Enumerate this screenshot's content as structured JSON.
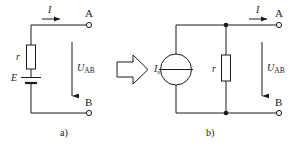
{
  "figure": {
    "background_color": "#ffffff",
    "line_color": "#1a1a1a",
    "captions": [
      {
        "id": "caption-a",
        "text": "a)"
      },
      {
        "id": "caption-b",
        "text": "b)"
      }
    ],
    "transform_arrow": {
      "name": "equivalence-arrow",
      "direction": "right",
      "meaning": "is equivalent to"
    }
  },
  "circuit_a": {
    "name": "voltage-source-circuit",
    "caption": "a)",
    "labels": {
      "current": "I",
      "resistor": "r",
      "emf": "E",
      "voltage": "U",
      "voltage_subscript": "AB",
      "terminal_top": "A",
      "terminal_bottom": "B"
    },
    "components": [
      {
        "type": "resistor",
        "label": "r",
        "orientation": "vertical"
      },
      {
        "type": "battery",
        "label": "E",
        "orientation": "vertical"
      },
      {
        "type": "terminal",
        "label": "A",
        "style": "open-circle"
      },
      {
        "type": "terminal",
        "label": "B",
        "style": "open-circle"
      }
    ],
    "arrows": [
      {
        "name": "current-arrow",
        "label": "I",
        "direction": "right"
      },
      {
        "name": "voltage-arrow",
        "label": "UAB",
        "direction": "down"
      }
    ]
  },
  "circuit_b": {
    "name": "current-source-circuit",
    "caption": "b)",
    "labels": {
      "current": "I",
      "source": "I",
      "source_subscript": "s",
      "resistor": "r",
      "voltage": "U",
      "voltage_subscript": "AB",
      "terminal_top": "A",
      "terminal_bottom": "B"
    },
    "components": [
      {
        "type": "current-source",
        "label": "Is",
        "shape": "circle-with-bar"
      },
      {
        "type": "resistor",
        "label": "r",
        "orientation": "vertical"
      },
      {
        "type": "junction-dot",
        "position": "top"
      },
      {
        "type": "junction-dot",
        "position": "bottom"
      },
      {
        "type": "terminal",
        "label": "A",
        "style": "open-circle"
      },
      {
        "type": "terminal",
        "label": "B",
        "style": "open-circle"
      }
    ],
    "arrows": [
      {
        "name": "current-arrow",
        "label": "I",
        "direction": "right"
      },
      {
        "name": "voltage-arrow",
        "label": "UAB",
        "direction": "down"
      }
    ]
  }
}
